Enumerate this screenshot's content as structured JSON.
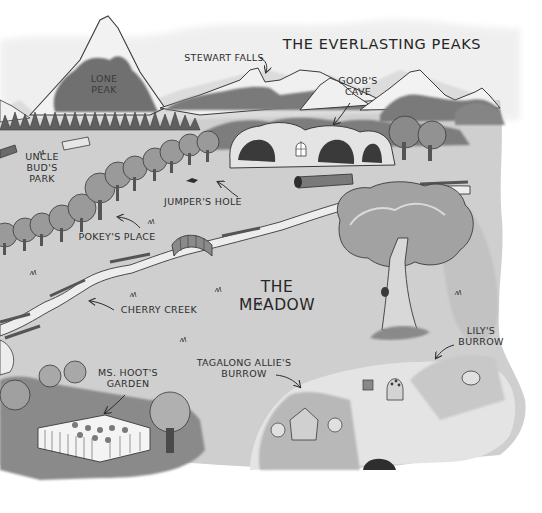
{
  "map": {
    "title": "The Everlasting Peaks",
    "region_label": "The Meadow",
    "colors": {
      "paper": "#ffffff",
      "meadow": "#cfcfcf",
      "meadow_dark": "#a9a9a9",
      "forest": "#6f6f6f",
      "forest_dark": "#555555",
      "snow": "#f2f2f2",
      "ink": "#2e2e2e",
      "creek": "#eeeeee",
      "cave": "#3a3a3a"
    },
    "places": [
      {
        "id": "lone-peak",
        "label": "Lone\nPeak"
      },
      {
        "id": "stewart-falls",
        "label": "Stewart Falls"
      },
      {
        "id": "goobs-cave",
        "label": "Goob's\nCave"
      },
      {
        "id": "uncle-buds-park",
        "label": "Uncle\nBud's\nPark"
      },
      {
        "id": "jumpers-hole",
        "label": "Jumper's Hole"
      },
      {
        "id": "pokeys-place",
        "label": "Pokey's Place"
      },
      {
        "id": "cherry-creek",
        "label": "Cherry Creek"
      },
      {
        "id": "lilys-burrow",
        "label": "Lily's\nBurrow"
      },
      {
        "id": "tagalong-allies-burrow",
        "label": "Tagalong Allie's\nBurrow"
      },
      {
        "id": "ms-hoots-garden",
        "label": "Ms. Hoot's\nGarden"
      }
    ]
  }
}
